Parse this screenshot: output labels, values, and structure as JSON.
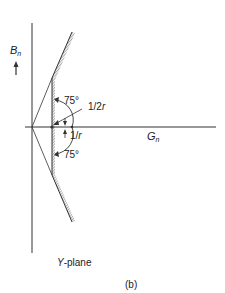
{
  "figure": {
    "caption": "(b)",
    "plane_label": "Y-plane",
    "plane_label_var": "Y",
    "plane_label_rest": "-plane"
  },
  "axes": {
    "vertical": {
      "var": "B",
      "sub": "n"
    },
    "horizontal": {
      "var": "G",
      "sub": "n"
    }
  },
  "annotations": {
    "angle_upper": "75°",
    "angle_lower": "75°",
    "half_inv_r": "1/2r",
    "half_inv_r_num": "1/2",
    "inv_r": "1/r",
    "inv_r_num": "1/",
    "r_var": "r"
  },
  "colors": {
    "line": "#333333",
    "hatch": "#555555",
    "background": "#ffffff"
  }
}
